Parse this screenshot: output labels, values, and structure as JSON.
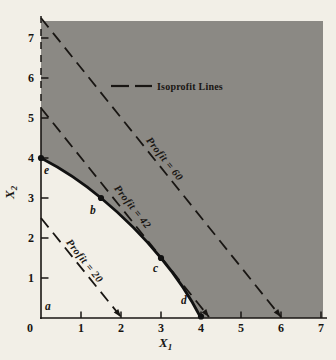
{
  "page": {
    "background": "#f2efe7"
  },
  "chart_data": {
    "type": "line",
    "title": "",
    "xlabel": {
      "base": "X",
      "sub": "1"
    },
    "ylabel": {
      "base": "X",
      "sub": "2"
    },
    "xlim": [
      0,
      7
    ],
    "ylim": [
      0,
      7.5
    ],
    "grid": false,
    "x_ticks": [
      "0",
      "1",
      "2",
      "3",
      "4",
      "5",
      "6",
      "7"
    ],
    "y_ticks": [
      "1",
      "2",
      "3",
      "4",
      "5",
      "6",
      "7"
    ],
    "legend": {
      "label": "Isoprofit Lines",
      "position": "top-center",
      "style": "dashed"
    },
    "isoprofit_lines": [
      {
        "label": "Profit = 20",
        "profit": 20,
        "points": [
          [
            0,
            2.5
          ],
          [
            2,
            0
          ]
        ],
        "arrow_end": true
      },
      {
        "label": "Profit = 42",
        "profit": 42,
        "points": [
          [
            0,
            5.25
          ],
          [
            4.2,
            0
          ]
        ],
        "arrow_end": true
      },
      {
        "label": "Profit = 60",
        "profit": 60,
        "points": [
          [
            0,
            7.5
          ],
          [
            6,
            0
          ]
        ],
        "arrow_end": true
      }
    ],
    "feasible_boundary": {
      "style": "solid-curve",
      "points": [
        {
          "label": "e",
          "x": 0,
          "y": 4
        },
        {
          "label": "b",
          "x": 1.5,
          "y": 3
        },
        {
          "label": "c",
          "x": 3,
          "y": 1.5
        },
        {
          "label": "d",
          "x": 4,
          "y": 0
        }
      ]
    },
    "origin_point": {
      "label": "a",
      "x": 0,
      "y": 0
    },
    "regions": {
      "shaded": "infeasible",
      "white": "feasible"
    },
    "colors": {
      "shaded": "#8b8984",
      "paper": "#f2efe7",
      "ink": "#191613",
      "curve": "#111111"
    }
  }
}
